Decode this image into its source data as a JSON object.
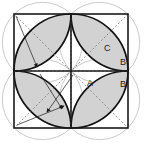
{
  "figure": {
    "background_color": "#ffffff",
    "square": {
      "x": 14,
      "y": 14,
      "size": 114,
      "stroke_color": "#1a1a1a",
      "stroke_width": 1.6,
      "midline_stroke_width": 1.6
    },
    "petal_fill_color": "#d2d2d2",
    "petal_stroke_color": "#111111",
    "petal_stroke_width": 1.7,
    "faint_circle_color": "#b3b3b3",
    "faint_circle_width": 0.7,
    "dashed_color": "#7a7a7a",
    "dashed_width": 0.8,
    "dash_pattern": "2,2",
    "arrow_color": "#1a1a1a",
    "quadrant_radius": 28.5,
    "labels": [
      {
        "id": "label-C",
        "text": "C",
        "x": 104,
        "y": 51
      },
      {
        "id": "label-B",
        "text": "B",
        "x": 120,
        "y": 65
      },
      {
        "id": "label-A",
        "text": "A",
        "x": 87,
        "y": 86
      },
      {
        "id": "label-Bp",
        "text": "B'",
        "x": 120,
        "y": 87
      }
    ],
    "center_point": {
      "x": 71,
      "y": 71
    },
    "quadrant_centers": [
      {
        "id": "top-left",
        "x": 42.5,
        "y": 42.5
      },
      {
        "id": "top-right",
        "x": 99.5,
        "y": 42.5
      },
      {
        "id": "bottom-left",
        "x": 42.5,
        "y": 99.5
      },
      {
        "id": "bottom-right",
        "x": 99.5,
        "y": 99.5
      }
    ]
  }
}
